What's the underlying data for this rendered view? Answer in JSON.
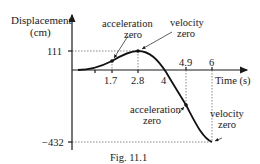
{
  "figure": {
    "caption": "Fig. 11.1",
    "y_axis_label_line1": "Displacement",
    "y_axis_label_line2": "(cm)",
    "x_axis_label": "Time (s)",
    "y_ticks": [
      "111",
      "−432"
    ],
    "x_ticks_below": [
      "1.7",
      "2.8",
      "4"
    ],
    "x_ticks_above": [
      "4.9",
      "6"
    ],
    "annotations": [
      {
        "line1": "acceleration",
        "line2": "zero",
        "at_time": "1.7"
      },
      {
        "line1": "velocity",
        "line2": "zero",
        "at_time": "2.8"
      },
      {
        "line1": "acceleration",
        "line2": "zero",
        "at_time": "4.9"
      },
      {
        "line1": "velocity",
        "line2": "zero",
        "at_time": "6"
      }
    ]
  },
  "colors": {
    "curve": "#111111",
    "axes": "#1a1a1a",
    "guides": "#555555"
  }
}
